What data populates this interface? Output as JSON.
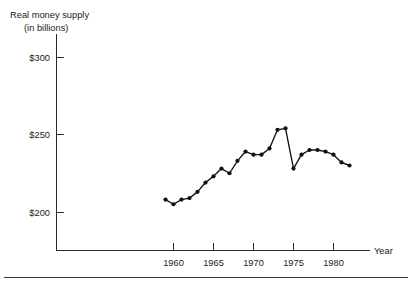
{
  "figure": {
    "title_line1": "Real money supply",
    "title_line2": "(in billions)",
    "x_axis_name": "Year",
    "background_color": "#ffffff",
    "ink_color": "#111111"
  },
  "chart_data": {
    "type": "line",
    "title": "Real money supply (in billions)",
    "xlabel": "Year",
    "ylabel": "Real money supply (in billions)",
    "xlim": [
      1957,
      1984
    ],
    "ylim": [
      190,
      305
    ],
    "grid": false,
    "legend": "none",
    "markers": "filled-circle",
    "y_tick_labels": [
      "$300",
      "$250",
      "$200"
    ],
    "y_tick_values": [
      300,
      250,
      200
    ],
    "x_tick_labels": [
      "1960",
      "1965",
      "1970",
      "1975",
      "1980"
    ],
    "x_tick_values": [
      1960,
      1965,
      1970,
      1975,
      1980
    ],
    "x": [
      1959,
      1960,
      1961,
      1962,
      1963,
      1964,
      1965,
      1966,
      1967,
      1968,
      1969,
      1970,
      1971,
      1972,
      1973,
      1974,
      1975,
      1976,
      1977,
      1978,
      1979,
      1980,
      1981,
      1982
    ],
    "values": [
      208,
      205,
      208,
      209,
      213,
      219,
      223,
      228,
      225,
      233,
      239,
      237,
      237,
      241,
      253,
      254,
      228,
      237,
      240,
      240,
      239,
      237,
      232,
      230
    ],
    "series": [
      {
        "name": "Real money supply",
        "values": [
          208,
          205,
          208,
          209,
          213,
          219,
          223,
          228,
          225,
          233,
          239,
          237,
          237,
          241,
          253,
          254,
          228,
          237,
          240,
          240,
          239,
          237,
          232,
          230
        ]
      }
    ]
  }
}
